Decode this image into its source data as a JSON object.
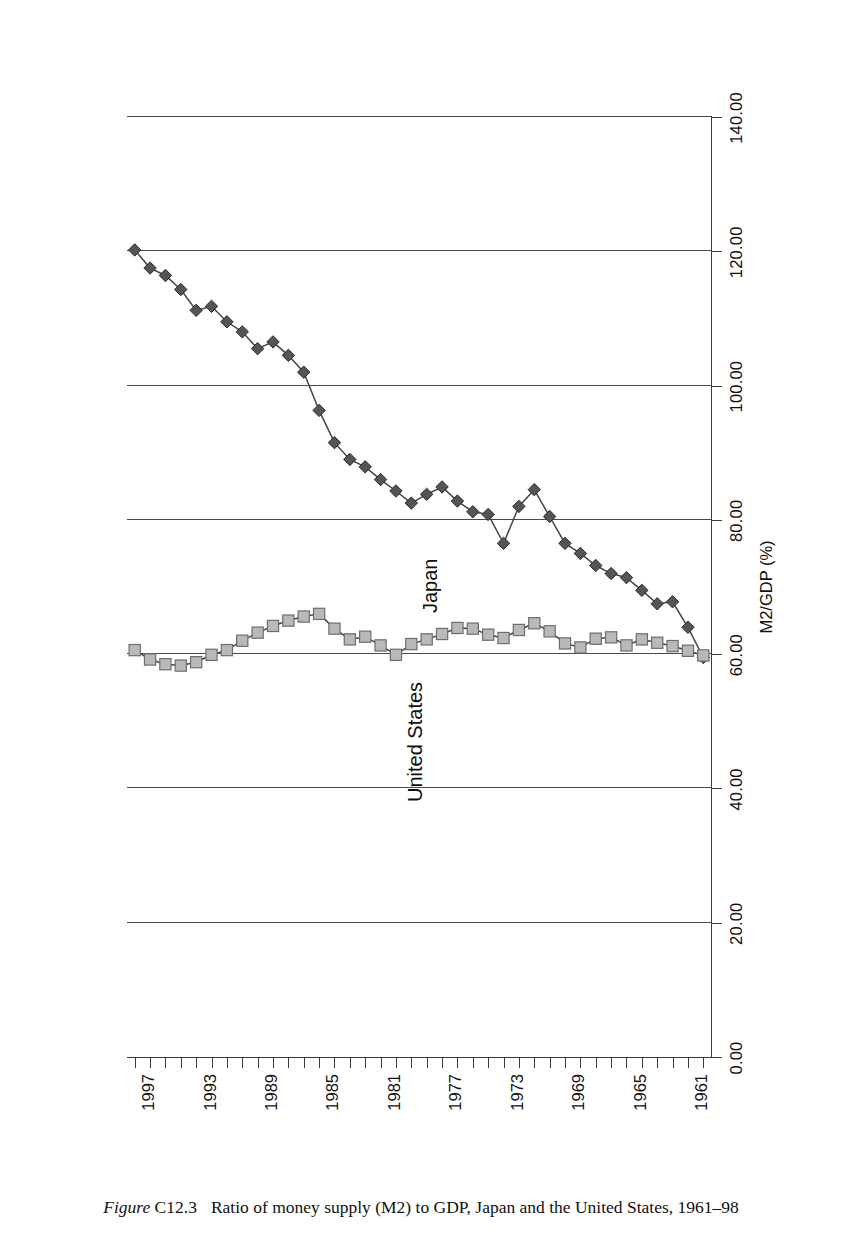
{
  "caption": {
    "figure_word": "Figure",
    "figure_number": "C12.3",
    "text": "Ratio of money supply (M2) to GDP, Japan and the United States, 1961–98"
  },
  "axis": {
    "value_axis_title": "M2/GDP (%)",
    "value_ticks": [
      "140.00",
      "120.00",
      "100.00",
      "80.00",
      "60.00",
      "40.00",
      "20.00",
      "0.00"
    ],
    "category_ticks_labeled": [
      "1961",
      "1965",
      "1969",
      "1973",
      "1977",
      "1981",
      "1985",
      "1989",
      "1993",
      "1997"
    ]
  },
  "series_labels": {
    "japan": "Japan",
    "united_states": "United States"
  },
  "colors": {
    "japan_marker": "#555555",
    "us_marker": "#b9b9b9",
    "line": "#444444",
    "axis": "#3b3b3b",
    "grid": "#4a4a4a",
    "background": "#ffffff"
  },
  "chart_data": {
    "type": "line",
    "title": "Ratio of money supply (M2) to GDP, Japan and the United States, 1961–98",
    "xlabel": "",
    "ylabel": "M2/GDP (%)",
    "ylim": [
      0,
      140
    ],
    "ytick_step": 20,
    "grid": true,
    "orientation": "rotated-90ccw",
    "legend": "inline-labels",
    "categories": [
      1961,
      1962,
      1963,
      1964,
      1965,
      1966,
      1967,
      1968,
      1969,
      1970,
      1971,
      1972,
      1973,
      1974,
      1975,
      1976,
      1977,
      1978,
      1979,
      1980,
      1981,
      1982,
      1983,
      1984,
      1985,
      1986,
      1987,
      1988,
      1989,
      1990,
      1991,
      1992,
      1993,
      1994,
      1995,
      1996,
      1997,
      1998
    ],
    "series": [
      {
        "name": "Japan",
        "marker": "diamond",
        "values": [
          59.5,
          64.0,
          67.8,
          67.5,
          69.5,
          71.4,
          72.0,
          73.2,
          75.0,
          76.5,
          80.5,
          84.5,
          82.0,
          76.5,
          80.8,
          81.2,
          82.8,
          84.9,
          83.8,
          82.5,
          84.3,
          86.0,
          87.9,
          89.0,
          91.5,
          96.3,
          102.0,
          104.5,
          106.5,
          105.5,
          108.0,
          109.5,
          111.8,
          111.2,
          114.3,
          116.4,
          117.5,
          120.2
        ]
      },
      {
        "name": "United States",
        "marker": "square",
        "values": [
          59.8,
          60.5,
          61.2,
          61.7,
          62.2,
          61.3,
          62.5,
          62.3,
          61.0,
          61.6,
          63.4,
          64.6,
          63.6,
          62.4,
          62.9,
          63.8,
          63.9,
          63.0,
          62.2,
          61.5,
          59.9,
          61.3,
          62.6,
          62.2,
          63.8,
          66.0,
          65.6,
          65.0,
          64.2,
          63.2,
          62.0,
          60.6,
          59.9,
          58.8,
          58.3,
          58.5,
          59.2,
          60.6
        ]
      }
    ]
  }
}
